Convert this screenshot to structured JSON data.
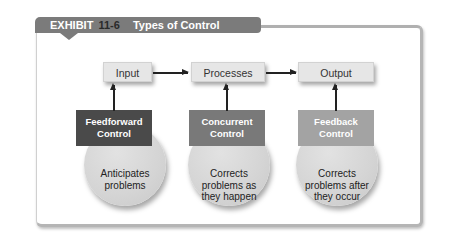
{
  "exhibit": {
    "label": "EXHIBIT",
    "number": "11-6",
    "title": "Types of Control",
    "tab_color": "#7b7b7b"
  },
  "stages": [
    {
      "label": "Input"
    },
    {
      "label": "Processes"
    },
    {
      "label": "Output"
    }
  ],
  "controls": [
    {
      "name": "Feedforward Control",
      "line1": "Feedforward",
      "line2": "Control",
      "description": "Anticipates problems",
      "desc_line1": "Anticipates",
      "desc_line2": "problems",
      "desc_line3": "",
      "color": "#4a4a4a"
    },
    {
      "name": "Concurrent Control",
      "line1": "Concurrent",
      "line2": "Control",
      "description": "Corrects problems as they happen",
      "desc_line1": "Corrects",
      "desc_line2": "problems as",
      "desc_line3": "they happen",
      "color": "#797979"
    },
    {
      "name": "Feedback Control",
      "line1": "Feedback",
      "line2": "Control",
      "description": "Corrects problems after they occur",
      "desc_line1": "Corrects",
      "desc_line2": "problems after",
      "desc_line3": "they occur",
      "color": "#a3a3a3"
    }
  ]
}
